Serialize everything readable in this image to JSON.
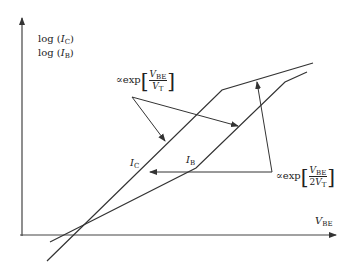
{
  "diagram": {
    "y_axis_label": {
      "line1_prefix": "log (",
      "line1_var": "I",
      "line1_sub": "C",
      "line1_suffix": ")",
      "line2_prefix": "log (",
      "line2_var": "I",
      "line2_sub": "B",
      "line2_suffix": ")"
    },
    "x_axis_label": {
      "var": "V",
      "sub": "BE"
    },
    "curves": [
      {
        "name": "collector current",
        "label_var": "I",
        "label_sub": "C"
      },
      {
        "name": "base current",
        "label_var": "I",
        "label_sub": "B"
      }
    ],
    "annotations": [
      {
        "prefix": "∝exp",
        "num_var": "V",
        "num_sub": "BE",
        "den_coef": "",
        "den_var": "V",
        "den_sub": "T",
        "points_to": "ideal region of both curves"
      },
      {
        "prefix": "∝exp",
        "num_var": "V",
        "num_sub": "BE",
        "den_coef": "2",
        "den_var": "V",
        "den_sub": "T",
        "points_to": "non-ideal regions of base current"
      }
    ],
    "colors": {
      "line": "#333333",
      "background": "#ffffff"
    }
  }
}
